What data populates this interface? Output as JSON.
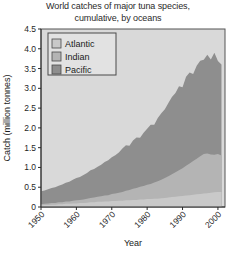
{
  "chart_data": {
    "type": "area",
    "title": "World catches of major tuna species, cumulative, by oceans",
    "title_line1": "World catches of major tuna species,",
    "title_line2": "cumulative, by oceans",
    "xlabel": "Year",
    "ylabel": "Catch (million tonnes)",
    "stacked": true,
    "grid": false,
    "legend_position": "top-left",
    "xlim": [
      1950,
      2002
    ],
    "ylim": [
      0,
      4.5
    ],
    "yticks": [
      0,
      0.5,
      1.0,
      1.5,
      2.0,
      2.5,
      3.0,
      3.5,
      4.0,
      4.5
    ],
    "ytick_labels": [
      "0",
      "0.5",
      "1.0",
      "1.5",
      "2.0",
      "2.5",
      "3.0",
      "3.5",
      "4.0",
      "4.5"
    ],
    "xticks": [
      1950,
      1960,
      1970,
      1980,
      1990,
      2000
    ],
    "xtick_labels": [
      "1950",
      "1960",
      "1970",
      "1980",
      "1990",
      "2000"
    ],
    "x": [
      1950,
      1951,
      1952,
      1953,
      1954,
      1955,
      1956,
      1957,
      1958,
      1959,
      1960,
      1961,
      1962,
      1963,
      1964,
      1965,
      1966,
      1967,
      1968,
      1969,
      1970,
      1971,
      1972,
      1973,
      1974,
      1975,
      1976,
      1977,
      1978,
      1979,
      1980,
      1981,
      1982,
      1983,
      1984,
      1985,
      1986,
      1987,
      1988,
      1989,
      1990,
      1991,
      1992,
      1993,
      1994,
      1995,
      1996,
      1997,
      1998,
      1999,
      2000,
      2001
    ],
    "series": [
      {
        "name": "Atlantic",
        "color": "#c9c9c9",
        "values": [
          0.04,
          0.05,
          0.05,
          0.06,
          0.06,
          0.07,
          0.07,
          0.08,
          0.08,
          0.09,
          0.09,
          0.1,
          0.1,
          0.11,
          0.12,
          0.12,
          0.13,
          0.13,
          0.14,
          0.14,
          0.15,
          0.15,
          0.16,
          0.16,
          0.17,
          0.17,
          0.18,
          0.18,
          0.19,
          0.19,
          0.2,
          0.2,
          0.21,
          0.21,
          0.22,
          0.23,
          0.24,
          0.25,
          0.26,
          0.27,
          0.28,
          0.29,
          0.3,
          0.31,
          0.32,
          0.33,
          0.34,
          0.35,
          0.36,
          0.37,
          0.38,
          0.38
        ]
      },
      {
        "name": "Indian",
        "color": "#b4b4b4",
        "values": [
          0.03,
          0.03,
          0.04,
          0.04,
          0.04,
          0.05,
          0.05,
          0.06,
          0.06,
          0.07,
          0.08,
          0.08,
          0.09,
          0.1,
          0.11,
          0.12,
          0.13,
          0.14,
          0.15,
          0.16,
          0.18,
          0.19,
          0.2,
          0.22,
          0.24,
          0.26,
          0.28,
          0.3,
          0.32,
          0.34,
          0.36,
          0.38,
          0.41,
          0.44,
          0.47,
          0.5,
          0.54,
          0.58,
          0.62,
          0.66,
          0.7,
          0.75,
          0.8,
          0.85,
          0.9,
          0.95,
          1.0,
          1.0,
          0.97,
          0.95,
          0.96,
          0.92
        ]
      },
      {
        "name": "Pacific",
        "color": "#8e8e8e",
        "values": [
          0.33,
          0.34,
          0.36,
          0.38,
          0.4,
          0.42,
          0.45,
          0.47,
          0.5,
          0.53,
          0.56,
          0.58,
          0.62,
          0.65,
          0.7,
          0.72,
          0.76,
          0.8,
          0.85,
          0.88,
          0.93,
          0.97,
          1.02,
          1.1,
          1.15,
          1.12,
          1.22,
          1.28,
          1.24,
          1.35,
          1.42,
          1.5,
          1.46,
          1.6,
          1.68,
          1.74,
          1.85,
          1.95,
          2.0,
          2.12,
          2.05,
          2.25,
          2.3,
          2.2,
          2.35,
          2.42,
          2.38,
          2.5,
          2.4,
          2.58,
          2.35,
          2.3
        ]
      }
    ],
    "totals": [
      0.4,
      0.42,
      0.45,
      0.48,
      0.5,
      0.54,
      0.57,
      0.61,
      0.64,
      0.69,
      0.73,
      0.76,
      0.81,
      0.86,
      0.93,
      0.96,
      1.02,
      1.07,
      1.14,
      1.18,
      1.26,
      1.31,
      1.38,
      1.48,
      1.56,
      1.55,
      1.68,
      1.76,
      1.75,
      1.88,
      1.98,
      2.08,
      2.08,
      2.25,
      2.37,
      2.47,
      2.63,
      2.78,
      2.88,
      3.05,
      3.03,
      3.29,
      3.4,
      3.36,
      3.57,
      3.7,
      3.72,
      3.85,
      3.73,
      3.9,
      3.69,
      3.6
    ]
  },
  "legend": {
    "items": [
      {
        "label": "Atlantic",
        "color": "#c9c9c9"
      },
      {
        "label": "Indian",
        "color": "#b4b4b4"
      },
      {
        "label": "Pacific",
        "color": "#8e8e8e"
      }
    ]
  }
}
